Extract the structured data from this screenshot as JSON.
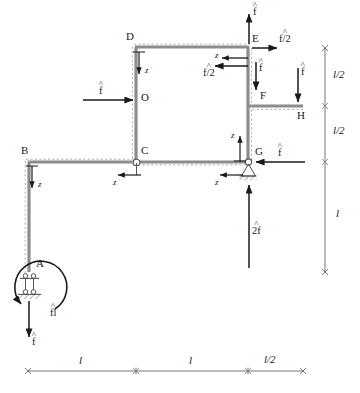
{
  "figure": {
    "type": "structural-frame-free-body-diagram",
    "member_color": "#8c8c8c",
    "dash_color": "#b3b3b3",
    "arrow_color": "#1a1a1a"
  },
  "nodes": [
    {
      "id": "A",
      "label": "A",
      "x": 36,
      "y": 266,
      "support": "double-link"
    },
    {
      "id": "B",
      "label": "B",
      "x": 22,
      "y": 152,
      "support": "none"
    },
    {
      "id": "C",
      "label": "C",
      "x": 141,
      "y": 152,
      "support": "hinge"
    },
    {
      "id": "D",
      "label": "D",
      "x": 130,
      "y": 38,
      "support": "none"
    },
    {
      "id": "O",
      "label": "O",
      "x": 142,
      "y": 98,
      "support": "none"
    },
    {
      "id": "E",
      "label": "E",
      "x": 251,
      "y": 38,
      "support": "none"
    },
    {
      "id": "F",
      "label": "F",
      "x": 255,
      "y": 96,
      "support": "none"
    },
    {
      "id": "G",
      "label": "G",
      "x": 254,
      "y": 152,
      "support": "pin"
    },
    {
      "id": "H",
      "label": "H",
      "x": 299,
      "y": 110,
      "support": "none"
    }
  ],
  "forces": [
    {
      "name": "force-at-E-up",
      "label": "f",
      "hat": true,
      "suffix": "",
      "direction": "up"
    },
    {
      "name": "force-at-E-right",
      "label": "f",
      "hat": true,
      "suffix": "/2",
      "direction": "right"
    },
    {
      "name": "force-at-E-left",
      "label": "f",
      "hat": true,
      "suffix": "/2",
      "direction": "left"
    },
    {
      "name": "force-at-EF-down",
      "label": "f",
      "hat": true,
      "suffix": "",
      "direction": "down"
    },
    {
      "name": "force-at-H-down",
      "label": "f",
      "hat": true,
      "suffix": "",
      "direction": "down"
    },
    {
      "name": "force-at-O-right",
      "label": "f",
      "hat": true,
      "suffix": "",
      "direction": "right"
    },
    {
      "name": "force-at-G-left",
      "label": "f",
      "hat": true,
      "suffix": "",
      "direction": "left"
    },
    {
      "name": "force-below-G-up",
      "label": "2f",
      "hat": true,
      "suffix": "",
      "direction": "up"
    },
    {
      "name": "force-at-A-down",
      "label": "f",
      "hat": true,
      "suffix": "",
      "direction": "down"
    },
    {
      "name": "moment-at-A-ccw",
      "label": "f",
      "hat": true,
      "suffix": "l",
      "direction": "counter-clockwise"
    }
  ],
  "axis_markers": [
    {
      "name": "z-axis-at-D",
      "label": "z",
      "direction": "down"
    },
    {
      "name": "z-axis-at-B",
      "label": "z",
      "direction": "down"
    },
    {
      "name": "z-axis-at-C",
      "label": "z",
      "direction": "left"
    },
    {
      "name": "z-axis-at-E",
      "label": "z",
      "direction": "left"
    },
    {
      "name": "z-axis-at-G",
      "label": "z",
      "direction": "left"
    },
    {
      "name": "z-axis-at-GF",
      "label": "z",
      "direction": "up"
    }
  ],
  "dimensions": {
    "horizontal": {
      "segments": [
        {
          "name": "dim-h-1",
          "label": "l"
        },
        {
          "name": "dim-h-2",
          "label": "l"
        },
        {
          "name": "dim-h-3",
          "label": "l/2"
        }
      ]
    },
    "vertical": {
      "segments": [
        {
          "name": "dim-v-1",
          "label": "l/2"
        },
        {
          "name": "dim-v-2",
          "label": "l/2"
        },
        {
          "name": "dim-v-3",
          "label": "l"
        }
      ]
    }
  },
  "labels": {
    "f_hat": "f",
    "f_hat_half": "f/2",
    "two_f_hat": "2f",
    "f_hat_l": "fl",
    "z": "z",
    "l": "l",
    "l_half": "l/2"
  }
}
